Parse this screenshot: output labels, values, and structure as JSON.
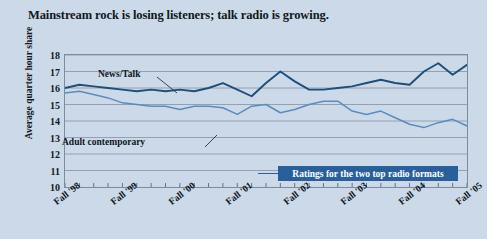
{
  "title": "Mainstream rock is losing listeners; talk radio is growing.",
  "legend_banner": "Ratings for the two top radio formats",
  "axis": {
    "ylabel": "Average quarter hour share",
    "yticks": [
      "18",
      "17",
      "16",
      "15",
      "14",
      "13",
      "12",
      "11",
      "10"
    ],
    "xticklabels": [
      "Fall '98",
      "Fall '99",
      "Fall '00",
      "Fall '01",
      "Fall '02",
      "Fall '03",
      "Fall '04",
      "Fall '05"
    ]
  },
  "series_labels": {
    "news_talk": "News/Talk",
    "adult_contemporary": "Adult contemporary"
  },
  "colors": {
    "background": "#ccd9e8",
    "news_talk": "#1f4e79",
    "adult_contemporary": "#5b8cc0",
    "banner": "#2a5f9e",
    "gridline": "#8d9aab",
    "border": "#7d8b9c",
    "text": "#111820"
  },
  "chart_data": {
    "type": "line",
    "title": "Mainstream rock is losing listeners; talk radio is growing.",
    "xlabel": "",
    "ylabel": "Average quarter hour share",
    "ylim": [
      10,
      18
    ],
    "grid": true,
    "legend_position": "inline-annotation",
    "categories": [
      "Fall '98",
      "Winter '99",
      "Spring '99",
      "Summer '99",
      "Fall '99",
      "Winter '00",
      "Spring '00",
      "Summer '00",
      "Fall '00",
      "Winter '01",
      "Spring '01",
      "Summer '01",
      "Fall '01",
      "Winter '02",
      "Spring '02",
      "Summer '02",
      "Fall '02",
      "Winter '03",
      "Spring '03",
      "Summer '03",
      "Fall '03",
      "Winter '04",
      "Spring '04",
      "Summer '04",
      "Fall '04",
      "Winter '05",
      "Spring '05",
      "Summer '05",
      "Fall '05"
    ],
    "xticklabels": [
      "Fall '98",
      "Fall '99",
      "Fall '00",
      "Fall '01",
      "Fall '02",
      "Fall '03",
      "Fall '04",
      "Fall '05"
    ],
    "series": [
      {
        "name": "News/Talk",
        "color": "#1f4e79",
        "values": [
          16.0,
          16.2,
          16.1,
          16.0,
          15.9,
          15.8,
          15.9,
          15.8,
          15.9,
          15.8,
          16.0,
          16.3,
          15.9,
          15.5,
          16.3,
          17.0,
          16.4,
          15.9,
          15.9,
          16.0,
          16.1,
          16.3,
          16.5,
          16.3,
          16.2,
          17.0,
          17.5,
          16.8,
          17.4
        ]
      },
      {
        "name": "Adult contemporary",
        "color": "#5b8cc0",
        "values": [
          15.7,
          15.8,
          15.6,
          15.4,
          15.1,
          15.0,
          14.9,
          14.9,
          14.7,
          14.9,
          14.9,
          14.8,
          14.4,
          14.9,
          15.0,
          14.5,
          14.7,
          15.0,
          15.2,
          15.2,
          14.6,
          14.4,
          14.6,
          14.2,
          13.8,
          13.6,
          13.9,
          14.1,
          13.7
        ]
      }
    ]
  }
}
